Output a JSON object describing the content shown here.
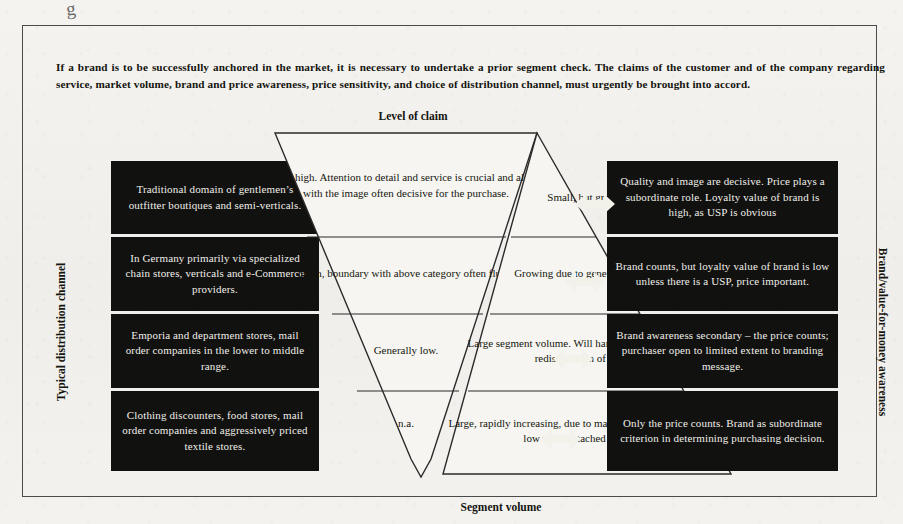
{
  "page": {
    "stray_mark": "g",
    "intro": "If a brand is to be successfully anchored in the market, it is necessary to undertake a prior segment check. The claims of the customer and of the company regarding service, market volume, brand and price awareness, price sensitivity, and choice of distribution channel, must urgently be brought into accord."
  },
  "axes": {
    "top_caption": "Level of claim",
    "bottom_caption": "Segment volume",
    "left_caption": "Typical distribution channel",
    "right_caption": "Brand/value-for-money awareness"
  },
  "colors": {
    "cell_fill": "#111110",
    "cell_text": "#f0efe9",
    "paper": "#f2f1ee",
    "ink": "#15150f",
    "frame_border": "#4b4b4b"
  },
  "icons": {
    "double_arrow": "double-arrow-icon"
  },
  "rows": [
    {
      "distribution_channel": "Traditional domain of gentlemen’s outfitter boutiques and semi-verticals.",
      "level_of_claim": "Very high. Attention to detail and service is crucial and along with the image often decisive for the purchase.",
      "segment_volume": "Small, but growing.",
      "brand_awareness": "Quality and image are decisive. Price plays a subordinate role. Loyalty value of brand is high, as USP is obvious"
    },
    {
      "distribution_channel": "In Germany primarily via specialized chain stores, verticals and e-Commerce providers.",
      "level_of_claim": "High, boundary with above category often fluid.",
      "segment_volume": "Growing due to general meltdown.",
      "brand_awareness": "Brand counts, but loyalty value of brand is low unless there is a USP, price important."
    },
    {
      "distribution_channel": "Emporia and department stores, mail order companies in the lower to middle range.",
      "level_of_claim": "Generally low.",
      "segment_volume": "Large segment volume. Will hardly grow. Rather expect redistribution of capacity.",
      "brand_awareness": "Brand awareness secondary – the price counts; purchaser open to limited extent to branding message."
    },
    {
      "distribution_channel": "Clothing discounters, food stores, mail order companies and aggressively priced textile stores.",
      "level_of_claim": "n.a.",
      "segment_volume": "Large, rapidly increasing, due to market polarization and general low value attached to clothing.",
      "brand_awareness": "Only the price counts. Brand as subordinate criterion in determining purchasing decision."
    }
  ]
}
